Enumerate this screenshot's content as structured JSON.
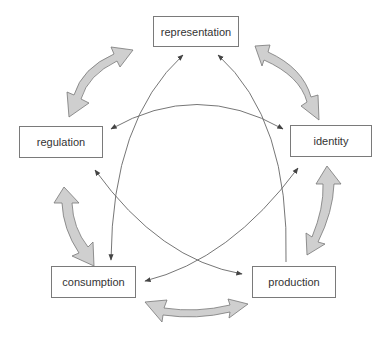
{
  "nodes": {
    "representation": "representation",
    "regulation": "regulation",
    "identity": "identity",
    "consumption": "consumption",
    "production": "production"
  },
  "colors": {
    "box_border": "#7a7a7a",
    "thin_arrow": "#555555",
    "block_arrow_fill": "#cfcfcf",
    "block_arrow_stroke": "#777777",
    "text": "#333333"
  },
  "connections": {
    "block_arrows": [
      {
        "from": "regulation",
        "to": "representation",
        "double_headed": true
      },
      {
        "from": "representation",
        "to": "identity",
        "double_headed": true
      },
      {
        "from": "identity",
        "to": "production",
        "double_headed": true
      },
      {
        "from": "production",
        "to": "consumption",
        "double_headed": true
      },
      {
        "from": "consumption",
        "to": "regulation",
        "double_headed": true
      }
    ],
    "thin_arrows": [
      {
        "from": "representation",
        "to": "consumption",
        "double_headed": true
      },
      {
        "from": "production",
        "to": "representation",
        "double_headed": false
      },
      {
        "from": "regulation",
        "to": "identity",
        "double_headed": true
      },
      {
        "from": "regulation",
        "to": "production",
        "double_headed": true
      },
      {
        "from": "identity",
        "to": "consumption",
        "double_headed": true
      }
    ]
  }
}
